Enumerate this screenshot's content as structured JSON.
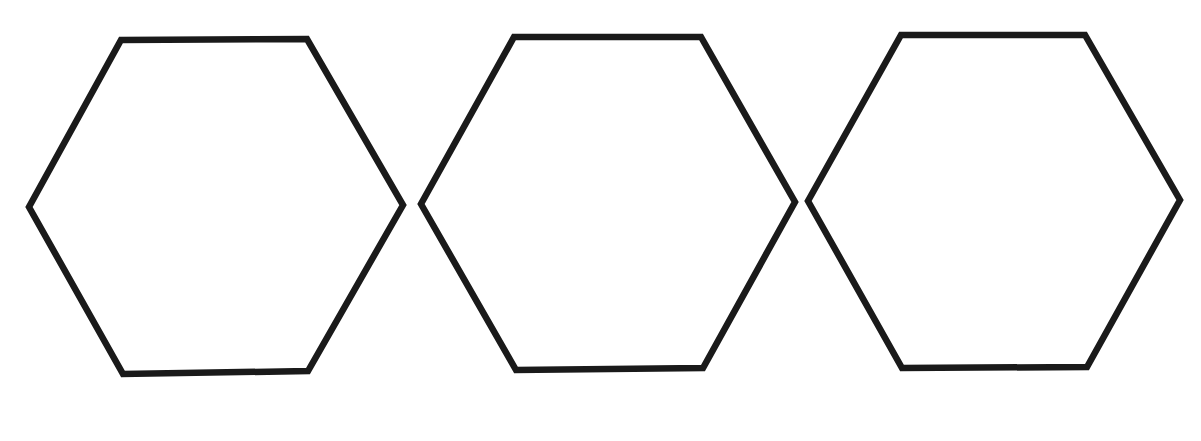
{
  "canvas": {
    "width": 1201,
    "height": 441,
    "background": "#ffffff"
  },
  "style": {
    "stroke_color": "#1a1a1a",
    "fill_color": "#ffffff",
    "stroke_width": 6.5
  },
  "shapes": [
    {
      "type": "hexagon",
      "orientation": "flat-top",
      "points": "121,40 307,39 403,205 308,371 123,374 29,207"
    },
    {
      "type": "hexagon",
      "orientation": "flat-top",
      "points": "514,37 701,37 795,202 703,368 516,370 421,204"
    },
    {
      "type": "hexagon",
      "orientation": "flat-top",
      "points": "901,35 1085,35 1180,200 1087,367 902,368 808,201"
    }
  ]
}
